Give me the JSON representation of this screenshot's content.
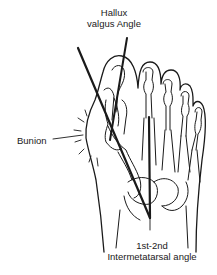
{
  "figure": {
    "labels": {
      "hallux_valgus_angle_line1": "Hallux",
      "hallux_valgus_angle_line2": "valgus Angle",
      "bunion": "Bunion",
      "intermetatarsal_line1": "1st-2nd",
      "intermetatarsal_line2": "Intermetatarsal angle"
    },
    "colors": {
      "ink": "#1a1a1a",
      "background": "#ffffff"
    }
  }
}
